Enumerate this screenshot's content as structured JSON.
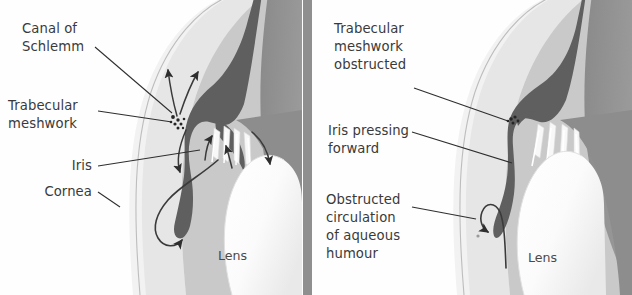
{
  "figure": {
    "divider": "panel-divider"
  },
  "palette": {
    "background": "#fefefe",
    "sclera_outer": "#f2f2f2",
    "cornea_band": "#e6e6e6",
    "anterior_chamber": "#c9c9c9",
    "vitreous_mid": "#8d8d8d",
    "iris_dark": "#5f5f5f",
    "lens_white": "#fdfdfd",
    "ciliary_white": "#f6f6f6",
    "ink": "#2e2e2e",
    "label_text": "#3a3a3a",
    "divider_gray": "#8f8f8f"
  },
  "panels": [
    {
      "id": "normal-eye",
      "name": "Normal aqueous circulation",
      "labels": [
        {
          "id": "canal-of-schlemm",
          "lines": [
            "Canal of",
            "Schlemm"
          ],
          "align": "left",
          "x": 22,
          "y": 33
        },
        {
          "id": "trabecular-meshwork",
          "lines": [
            "Trabecular",
            "meshwork"
          ],
          "align": "left",
          "x": 8,
          "y": 110
        },
        {
          "id": "iris",
          "lines": [
            "Iris"
          ],
          "align": "right",
          "x": 92,
          "y": 170
        },
        {
          "id": "cornea",
          "lines": [
            "Cornea"
          ],
          "align": "right",
          "x": 92,
          "y": 196
        }
      ],
      "lens_label": {
        "id": "lens",
        "text": "Lens",
        "x": 218,
        "y": 260
      }
    },
    {
      "id": "glaucoma-eye",
      "name": "Angle-closure glaucoma",
      "labels": [
        {
          "id": "trabecular-meshwork-obstructed",
          "lines": [
            "Trabecular",
            "meshwork",
            "obstructed"
          ],
          "align": "left",
          "x": 334,
          "y": 33
        },
        {
          "id": "iris-pressing-forward",
          "lines": [
            "Iris pressing",
            "forward"
          ],
          "align": "left",
          "x": 328,
          "y": 135
        },
        {
          "id": "obstructed-circulation",
          "lines": [
            "Obstructed",
            "circulation",
            "of aqueous",
            "humour"
          ],
          "align": "left",
          "x": 326,
          "y": 204
        }
      ],
      "lens_label": {
        "id": "lens",
        "text": "Lens",
        "x": 528,
        "y": 262
      }
    }
  ]
}
